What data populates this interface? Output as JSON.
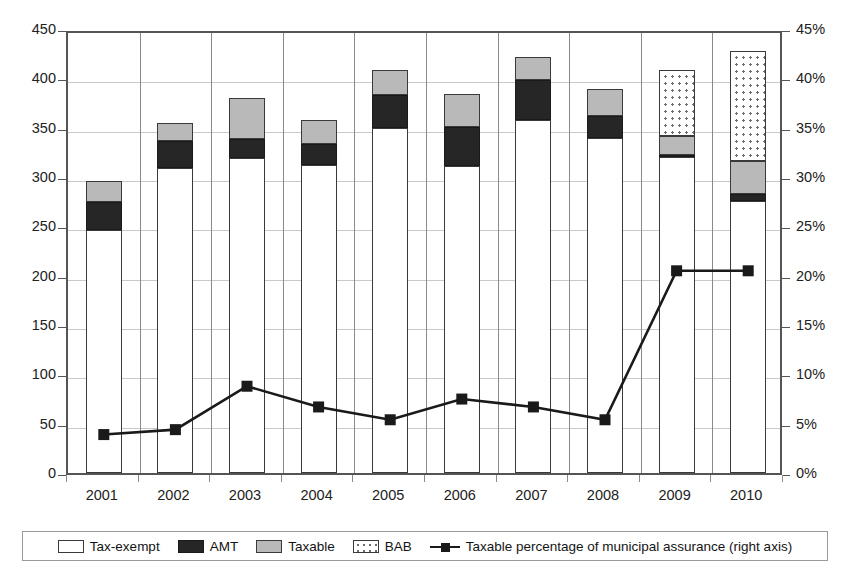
{
  "chart_data": {
    "type": "bar",
    "title": "",
    "subtitle": "",
    "xlabel": "",
    "ylabel": "",
    "y2label": "",
    "categories": [
      "2001",
      "2002",
      "2003",
      "2004",
      "2005",
      "2006",
      "2007",
      "2008",
      "2009",
      "2010"
    ],
    "ylim": [
      0,
      450
    ],
    "yticks": [
      "0",
      "50",
      "100",
      "150",
      "200",
      "250",
      "300",
      "350",
      "400",
      "450"
    ],
    "y2lim": [
      0,
      45
    ],
    "y2ticks": [
      "0%",
      "5%",
      "10%",
      "15%",
      "20%",
      "25%",
      "30%",
      "35%",
      "40%",
      "45%"
    ],
    "grid": true,
    "legend_position": "bottom",
    "stacked": true,
    "series": [
      {
        "name": "Tax-exempt",
        "type": "bar",
        "axis": "left",
        "color": "#ffffff",
        "values": [
          246,
          309,
          319,
          312,
          350,
          311,
          358,
          340,
          320,
          276
        ]
      },
      {
        "name": "AMT",
        "type": "bar",
        "axis": "left",
        "color": "#262626",
        "values": [
          29,
          27,
          20,
          21,
          33,
          40,
          40,
          22,
          2,
          7
        ]
      },
      {
        "name": "Taxable",
        "type": "bar",
        "axis": "left",
        "color": "#b9b9b9",
        "values": [
          21,
          19,
          41,
          25,
          25,
          33,
          24,
          27,
          20,
          33
        ]
      },
      {
        "name": "BAB",
        "type": "bar",
        "axis": "left",
        "color": "#ffffff",
        "values": [
          0,
          0,
          0,
          0,
          0,
          0,
          0,
          0,
          66,
          112
        ]
      },
      {
        "name": "Taxable percentage of municipal assurance (right axis)",
        "type": "line",
        "axis": "right",
        "color": "#1a1a1a",
        "values": [
          4.3,
          4.8,
          9.2,
          7.1,
          5.8,
          7.9,
          7.1,
          5.8,
          20.9,
          20.9
        ]
      }
    ],
    "bar_totals": [
      296,
      355,
      380,
      358,
      408,
      384,
      422,
      389,
      408,
      428
    ]
  },
  "legend": {
    "items": [
      {
        "label": "Tax-exempt",
        "swatch": "taxexempt"
      },
      {
        "label": "AMT",
        "swatch": "amt"
      },
      {
        "label": "Taxable",
        "swatch": "taxable"
      },
      {
        "label": "BAB",
        "swatch": "bab"
      },
      {
        "label": "Taxable percentage of municipal assurance (right axis)",
        "swatch": "line"
      }
    ]
  }
}
